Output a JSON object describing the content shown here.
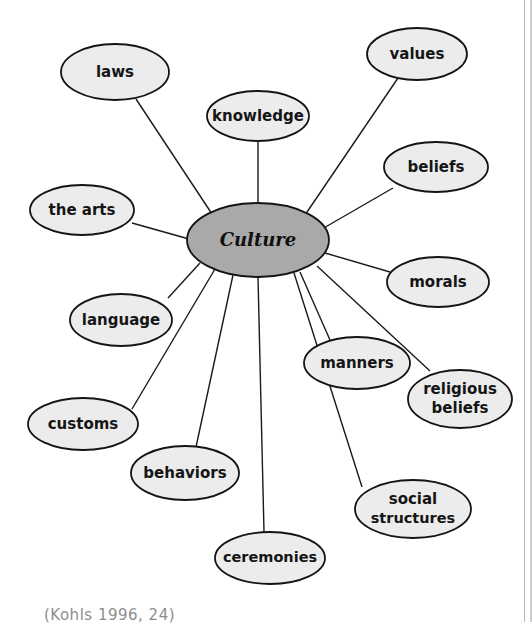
{
  "diagram": {
    "type": "spider-concept-map",
    "center": {
      "label": "Culture",
      "cx": 258,
      "cy": 240,
      "rx": 71,
      "ry": 37,
      "fill": "#a9a9a9",
      "stroke": "#141414"
    },
    "node_style": {
      "fill": "#ececec",
      "stroke": "#141414"
    },
    "edge_color": "#1a1a1a",
    "nodes": [
      {
        "id": "laws",
        "label": "laws",
        "lines": [
          "laws"
        ],
        "cx": 115,
        "cy": 72,
        "rx": 54,
        "ry": 28,
        "anchor_x": 136,
        "anchor_y": 99
      },
      {
        "id": "knowledge",
        "label": "knowledge",
        "lines": [
          "knowledge"
        ],
        "cx": 258,
        "cy": 116,
        "rx": 51,
        "ry": 25,
        "anchor_x": 258,
        "anchor_y": 141
      },
      {
        "id": "values",
        "label": "values",
        "lines": [
          "values"
        ],
        "cx": 417,
        "cy": 54,
        "rx": 50,
        "ry": 26,
        "anchor_x": 398,
        "anchor_y": 78
      },
      {
        "id": "beliefs",
        "label": "beliefs",
        "lines": [
          "beliefs"
        ],
        "cx": 436,
        "cy": 167,
        "rx": 52,
        "ry": 25,
        "anchor_x": 393,
        "anchor_y": 188
      },
      {
        "id": "morals",
        "label": "morals",
        "lines": [
          "morals"
        ],
        "cx": 438,
        "cy": 282,
        "rx": 51,
        "ry": 25,
        "anchor_x": 390,
        "anchor_y": 272
      },
      {
        "id": "religious-beliefs",
        "label": "religious beliefs",
        "lines": [
          "religious",
          "beliefs"
        ],
        "cx": 460,
        "cy": 399,
        "rx": 52,
        "ry": 29,
        "anchor_x": 430,
        "anchor_y": 371
      },
      {
        "id": "social-structures",
        "label": "social structures",
        "lines": [
          "social",
          "structures"
        ],
        "cx": 413,
        "cy": 509,
        "rx": 58,
        "ry": 29,
        "anchor_x": 362,
        "anchor_y": 487
      },
      {
        "id": "manners",
        "label": "manners",
        "lines": [
          "manners"
        ],
        "cx": 357,
        "cy": 363,
        "rx": 53,
        "ry": 26,
        "anchor_x": 330,
        "anchor_y": 340
      },
      {
        "id": "ceremonies",
        "label": "ceremonies",
        "lines": [
          "ceremonies"
        ],
        "cx": 270,
        "cy": 558,
        "rx": 55,
        "ry": 26,
        "anchor_x": 264,
        "anchor_y": 532
      },
      {
        "id": "behaviors",
        "label": "behaviors",
        "lines": [
          "behaviors"
        ],
        "cx": 185,
        "cy": 473,
        "rx": 54,
        "ry": 27,
        "anchor_x": 196,
        "anchor_y": 447
      },
      {
        "id": "customs",
        "label": "customs",
        "lines": [
          "customs"
        ],
        "cx": 83,
        "cy": 424,
        "rx": 55,
        "ry": 26,
        "anchor_x": 132,
        "anchor_y": 409
      },
      {
        "id": "language",
        "label": "language",
        "lines": [
          "language"
        ],
        "cx": 121,
        "cy": 320,
        "rx": 51,
        "ry": 26,
        "anchor_x": 168,
        "anchor_y": 298
      },
      {
        "id": "the-arts",
        "label": "the arts",
        "lines": [
          "the arts"
        ],
        "cx": 82,
        "cy": 210,
        "rx": 52,
        "ry": 25,
        "anchor_x": 132,
        "anchor_y": 223
      }
    ],
    "edges": [
      {
        "from": "laws",
        "x1": 136,
        "y1": 99,
        "x2": 212,
        "y2": 214
      },
      {
        "from": "knowledge",
        "x1": 258,
        "y1": 141,
        "x2": 258,
        "y2": 204
      },
      {
        "from": "values",
        "x1": 398,
        "y1": 78,
        "x2": 305,
        "y2": 215
      },
      {
        "from": "beliefs",
        "x1": 393,
        "y1": 188,
        "x2": 322,
        "y2": 229
      },
      {
        "from": "morals",
        "x1": 390,
        "y1": 272,
        "x2": 325,
        "y2": 253
      },
      {
        "from": "religious-beliefs",
        "x1": 430,
        "y1": 371,
        "x2": 317,
        "y2": 266
      },
      {
        "from": "social-structures",
        "x1": 362,
        "y1": 487,
        "x2": 294,
        "y2": 273
      },
      {
        "from": "manners",
        "x1": 330,
        "y1": 340,
        "x2": 300,
        "y2": 272
      },
      {
        "from": "ceremonies",
        "x1": 264,
        "y1": 532,
        "x2": 258,
        "y2": 277
      },
      {
        "from": "behaviors",
        "x1": 196,
        "y1": 447,
        "x2": 233,
        "y2": 275
      },
      {
        "from": "customs",
        "x1": 132,
        "y1": 409,
        "x2": 215,
        "y2": 269
      },
      {
        "from": "language",
        "x1": 168,
        "y1": 298,
        "x2": 200,
        "y2": 263
      },
      {
        "from": "the-arts",
        "x1": 132,
        "y1": 223,
        "x2": 189,
        "y2": 239
      }
    ]
  },
  "caption": {
    "text": "(Kohls 1996, 24)"
  }
}
